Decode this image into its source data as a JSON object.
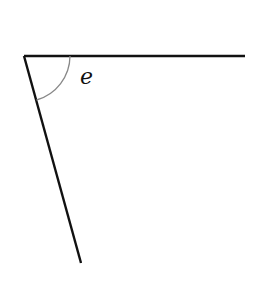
{
  "diagram": {
    "type": "angle",
    "angle_label": "e",
    "colors": {
      "lines": "#111111",
      "arc": "#888888",
      "background": "#ffffff"
    }
  }
}
